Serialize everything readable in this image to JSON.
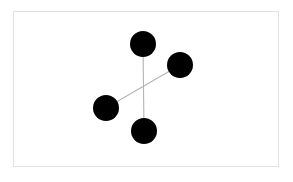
{
  "figure": {
    "kind": "node-link-diagram",
    "background_color": "#ffffff",
    "frame": {
      "visible": true,
      "border_color": "#e2e2e2",
      "fill_color": "#ffffff",
      "x": 13,
      "y": 11,
      "width": 266,
      "height": 156
    },
    "node_style": {
      "color": "#000000",
      "shape": "circle",
      "radius": 13
    },
    "edge_style": {
      "color": "#b4b4b4",
      "width": 1.1
    }
  },
  "chart_data": {
    "type": "scatter",
    "title": "",
    "xlabel": "",
    "ylabel": "",
    "grid": false,
    "legend": "none",
    "xlim": [
      13,
      279
    ],
    "ylim": [
      11,
      167
    ],
    "nodes": [
      {
        "id": "top",
        "label": "",
        "x": 143,
        "y": 44,
        "r": 13,
        "color": "#000000"
      },
      {
        "id": "right",
        "label": "",
        "x": 180,
        "y": 65,
        "r": 13,
        "color": "#000000"
      },
      {
        "id": "left",
        "label": "",
        "x": 106,
        "y": 108,
        "r": 13,
        "color": "#000000"
      },
      {
        "id": "bottom",
        "label": "",
        "x": 144,
        "y": 131,
        "r": 13,
        "color": "#000000"
      }
    ],
    "edges": [
      {
        "source": "top",
        "target": "bottom",
        "label": "",
        "color": "#b4b4b4"
      },
      {
        "source": "left",
        "target": "right",
        "label": "",
        "color": "#b4b4b4"
      }
    ]
  }
}
